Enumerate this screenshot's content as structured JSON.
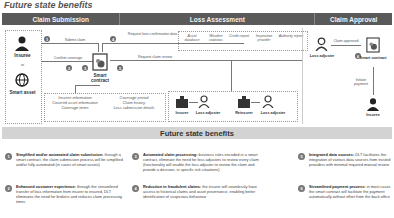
{
  "title": "Future state benefits",
  "phases": [
    {
      "label": "Claim Submission"
    },
    {
      "label": "Loss Assessment"
    },
    {
      "label": "Claim Approval"
    }
  ],
  "actors": {
    "insuree": "Insuree",
    "or": "or",
    "smart_asset": "Smart asset",
    "smart_contract": "Smart contract",
    "loss_adjuster": "Loss adjuster",
    "smart_contract_2": "Smart contract",
    "insuree_2": "Insuree"
  },
  "flows": {
    "submit_claim": "Submit claim",
    "confirm_coverage": "Confirm coverage",
    "request_loss_data": "Request loss confirmation data",
    "request_claim_review": "Request claim review",
    "claim_approved": "Claim approved",
    "initiate_payment": "Initiate payment"
  },
  "steps": [
    "1",
    "2",
    "3",
    "4",
    "5",
    "6",
    "7",
    "8"
  ],
  "data_sources": [
    "Asset database",
    "Weather statistics",
    "Credit report",
    "Inspection provider",
    "Authority report"
  ],
  "contract_data_left": [
    "Insuree information",
    "Covered asset information",
    "Coverage items"
  ],
  "contract_data_right": [
    "Coverage period",
    "Claim history",
    "Loss submission details"
  ],
  "review_parties": [
    "Insurer",
    "Loss adjuster",
    "Reinsurer",
    "Loss adjuster"
  ],
  "benefits_banner": "Future state benefits",
  "benefits": [
    {
      "num": "1",
      "bold": "Simplified and/or automated claim submission:",
      "text": " through a smart contract, the claim submission process will be simplified and/or fully automated (in cases of smart assets)"
    },
    {
      "num": "2",
      "bold": "Enhanced customer experience:",
      "text": " through the streamlined transfer of loss information from insurer to insured, DLT eliminates the need for brokers and reduces claim processing times"
    },
    {
      "num": "3",
      "bold": "Automated claim processing:",
      "text": " business rules encoded in a smart contract, eliminate the need for loss adjusters to review every claim (functionality will enable the loss adjuster to review the claim and provide a decision, in specific risk situations)"
    },
    {
      "num": "4",
      "bold": "Reduction in fraudulent claims:",
      "text": " the insurer will seamlessly have access to historical claims and asset provenance, enabling better identification of suspicious behaviour"
    },
    {
      "num": "5",
      "bold": "Integrated data sources:",
      "text": " DLT facilitates the integration of various data sources from trusted providers with minimal required manual review"
    },
    {
      "num": "6",
      "bold": "Streamlined payment process:",
      "text": " in most cases the smart contract will facilitate the payment automatically without effort from the back office"
    }
  ],
  "colors": {
    "phase_bar": "#5a5a5a",
    "banner": "#d3d3d3",
    "step_badge": "#6b6b6b"
  }
}
